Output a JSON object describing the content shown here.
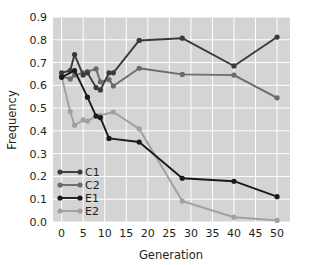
{
  "chart_data": {
    "type": "line",
    "title": "",
    "xlabel": "Generation",
    "ylabel": "Frequency",
    "xlim": [
      -2,
      53
    ],
    "ylim": [
      0.0,
      0.9
    ],
    "xticks": [
      0,
      5,
      10,
      15,
      20,
      25,
      30,
      35,
      40,
      45,
      50
    ],
    "xtick_labels": [
      "0",
      "5",
      "10",
      "15",
      "20",
      "25",
      "30",
      "35",
      "40",
      "45",
      "50"
    ],
    "yticks": [
      0.0,
      0.1,
      0.2,
      0.3,
      0.4,
      0.5,
      0.6,
      0.7,
      0.8,
      0.9
    ],
    "ytick_labels": [
      "0.0",
      "0.1",
      "0.2",
      "0.3",
      "0.4",
      "0.5",
      "0.6",
      "0.7",
      "0.8",
      "0.9"
    ],
    "grid": true,
    "grid_color": "#ffffff",
    "plot_background": "#d4d4d4",
    "legend_position": "lower-left",
    "legend_entries": [
      "C1",
      "C2",
      "E1",
      "E2"
    ],
    "series": [
      {
        "name": "C1",
        "color": "#3a3a3a",
        "marker": "circle",
        "x": [
          0,
          2,
          3,
          5,
          6,
          8,
          9,
          11,
          12,
          18,
          28,
          40,
          50
        ],
        "y": [
          0.655,
          0.665,
          0.735,
          0.645,
          0.655,
          0.59,
          0.58,
          0.655,
          0.655,
          0.797,
          0.807,
          0.685,
          0.812
        ]
      },
      {
        "name": "C2",
        "color": "#6b6b6b",
        "marker": "circle",
        "x": [
          0,
          2,
          3,
          5,
          6,
          8,
          9,
          11,
          12,
          18,
          28,
          40,
          50
        ],
        "y": [
          0.64,
          0.628,
          0.645,
          0.655,
          0.66,
          0.672,
          0.615,
          0.625,
          0.597,
          0.675,
          0.648,
          0.645,
          0.545
        ]
      },
      {
        "name": "E1",
        "color": "#1a1a1a",
        "marker": "circle",
        "x": [
          0,
          3,
          6,
          8,
          9,
          11,
          18,
          28,
          40,
          50
        ],
        "y": [
          0.635,
          0.665,
          0.548,
          0.465,
          0.458,
          0.367,
          0.351,
          0.192,
          0.179,
          0.111
        ]
      },
      {
        "name": "E2",
        "color": "#a0a0a0",
        "marker": "circle",
        "x": [
          0,
          2,
          3,
          5,
          6,
          8,
          9,
          12,
          18,
          28,
          40,
          50
        ],
        "y": [
          0.638,
          0.485,
          0.425,
          0.448,
          0.443,
          0.465,
          0.468,
          0.483,
          0.409,
          0.092,
          0.021,
          0.007
        ]
      }
    ]
  }
}
